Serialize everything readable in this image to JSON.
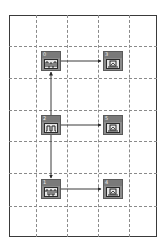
{
  "diagram": {
    "type": "block-diagram",
    "grid": {
      "columns_x": [
        36,
        67,
        98,
        129
      ],
      "rows_y": [
        46,
        78,
        110,
        141,
        173,
        206
      ],
      "style": "dashed"
    },
    "colors": {
      "block_fill": "#8c8c8c",
      "block_header": "#7a7a7a",
      "panel": "#e6e6e6",
      "link": "#3a3a3a",
      "grid": "#8a8a8a"
    },
    "blocks": [
      {
        "id": "0",
        "label": "0",
        "kind": "signal-source",
        "icon": "waveform-icon"
      },
      {
        "id": "3",
        "label": "3",
        "kind": "scope",
        "icon": "scope-icon"
      },
      {
        "id": "2",
        "label": "2",
        "kind": "signal-source",
        "icon": "pulse-icon"
      },
      {
        "id": "5",
        "label": "5",
        "kind": "scope",
        "icon": "scope-icon"
      },
      {
        "id": "1",
        "label": "1",
        "kind": "signal-source",
        "icon": "waveform-icon"
      },
      {
        "id": "4",
        "label": "4",
        "kind": "scope",
        "icon": "scope-icon"
      }
    ],
    "links": [
      {
        "from": "0",
        "to": "3"
      },
      {
        "from": "2",
        "to": "5"
      },
      {
        "from": "1",
        "to": "4"
      },
      {
        "from": "2",
        "to": "0"
      },
      {
        "from": "2",
        "to": "1"
      }
    ]
  }
}
